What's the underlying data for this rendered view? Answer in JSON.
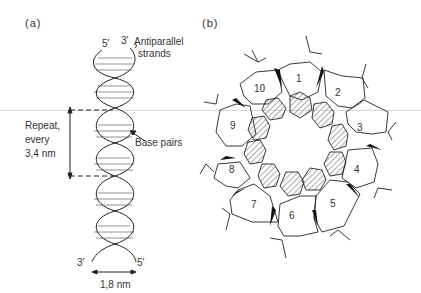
{
  "panel_a": {
    "label": "(a)",
    "top_five_prime": "5′",
    "top_three_prime": "3′",
    "antiparallel_line1": "Antiparallel",
    "antiparallel_line2": "strands",
    "repeat_line1": "Repeat,",
    "repeat_line2": "every",
    "repeat_line3": "3,4 nm",
    "base_pairs": "Base pairs",
    "bottom_three_prime": "3′",
    "bottom_five_prime": "5′",
    "width_label": "1,8 nm"
  },
  "panel_b": {
    "label": "(b)",
    "units": [
      "1",
      "2",
      "3",
      "4",
      "5",
      "6",
      "7",
      "8",
      "9",
      "10"
    ]
  },
  "colors": {
    "line": "#222222",
    "hatch": "#555555",
    "background": "#ffffff"
  }
}
